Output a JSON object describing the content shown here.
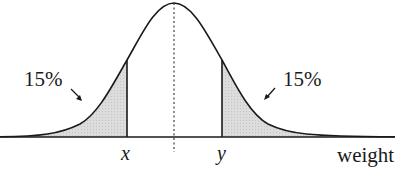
{
  "diagram": {
    "type": "normal-distribution-curve",
    "axis_label": "weight",
    "left_tail": {
      "percent_label": "15%",
      "cut_label": "x"
    },
    "right_tail": {
      "percent_label": "15%",
      "cut_label": "y"
    },
    "colors": {
      "line": "#1a1a1a",
      "shade": "#d9d9d9",
      "background": "#ffffff"
    }
  }
}
